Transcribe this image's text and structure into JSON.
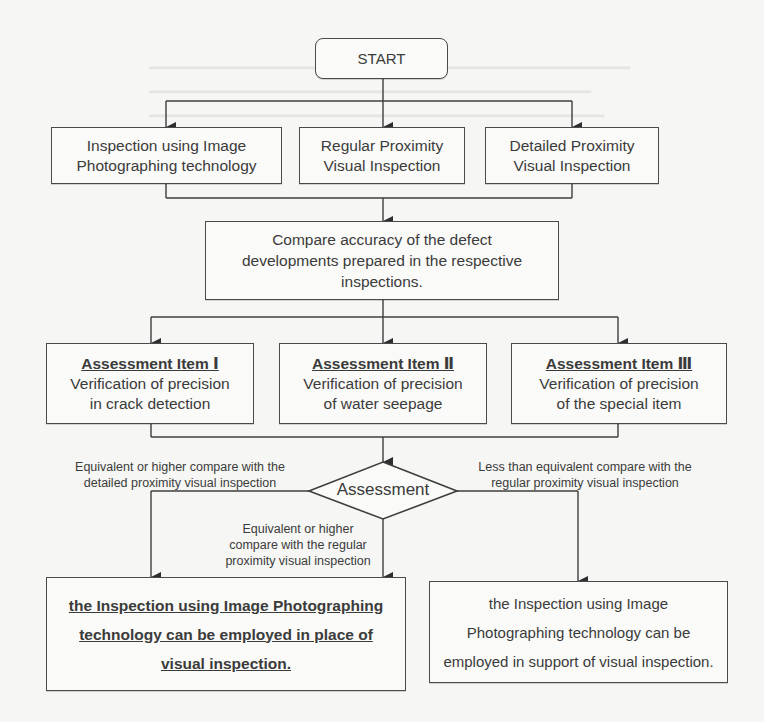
{
  "flowchart": {
    "start": {
      "label": "START"
    },
    "inspection_methods": [
      {
        "lines": [
          "Inspection using Image",
          "Photographing technology"
        ]
      },
      {
        "lines": [
          "Regular Proximity",
          "Visual Inspection"
        ]
      },
      {
        "lines": [
          "Detailed Proximity",
          "Visual Inspection"
        ]
      }
    ],
    "compare": {
      "lines": [
        "Compare accuracy of the defect",
        "developments prepared in the respective",
        "inspections."
      ]
    },
    "assessment_items": [
      {
        "title": "Assessment Item Ⅰ",
        "lines": [
          "Verification of precision",
          "in crack detection"
        ]
      },
      {
        "title": "Assessment Item Ⅱ",
        "lines": [
          "Verification of precision",
          "of water seepage"
        ]
      },
      {
        "title": "Assessment Item Ⅲ",
        "lines": [
          "Verification of precision",
          "of the special item"
        ]
      }
    ],
    "decision": {
      "label": "Assessment"
    },
    "edge_labels": {
      "left": [
        "Equivalent or higher compare with the",
        "detailed proximity visual inspection"
      ],
      "middle": [
        "Equivalent or higher",
        "compare with the regular",
        "proximity visual inspection"
      ],
      "right": [
        "Less than equivalent compare with the",
        "regular proximity visual inspection"
      ]
    },
    "outcomes": {
      "replace": {
        "lines": [
          "the Inspection using  Image Photographing",
          "technology can be employed in place of",
          "visual inspection."
        ]
      },
      "support": {
        "lines": [
          "the Inspection using Image",
          "Photographing technology can be",
          "employed in support of visual inspection."
        ]
      }
    }
  },
  "colors": {
    "line": "#3e3e3e",
    "box_border": "#4a4a4a",
    "text": "#3b3b3b",
    "background": "#f6f6f4"
  }
}
